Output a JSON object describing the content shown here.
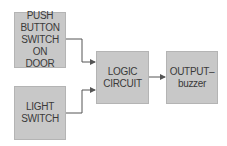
{
  "diagram": {
    "nodes": [
      {
        "id": "push_button",
        "label": "PUSH\nBUTTON\nSWITCH ON\nDOOR"
      },
      {
        "id": "light_switch",
        "label": "LIGHT\nSWITCH"
      },
      {
        "id": "logic_circuit",
        "label": "LOGIC\nCIRCUIT"
      },
      {
        "id": "output_buzzer",
        "label": "OUTPUT–\nbuzzer"
      }
    ],
    "edges": [
      {
        "from": "push_button",
        "to": "logic_circuit"
      },
      {
        "from": "light_switch",
        "to": "logic_circuit"
      },
      {
        "from": "logic_circuit",
        "to": "output_buzzer"
      }
    ],
    "colors": {
      "box_fill": "#c8c8c8",
      "line": "#555555",
      "text": "#3a3a3a"
    }
  }
}
